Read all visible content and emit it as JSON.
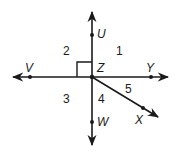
{
  "diagram": {
    "type": "geometry-lines-angles",
    "color": "#1a1a1a",
    "center_point": {
      "label": "Z",
      "x": 92,
      "y": 77
    },
    "points": [
      {
        "label": "U",
        "x": 92,
        "y": 35,
        "label_x": 97,
        "label_y": 38
      },
      {
        "label": "V",
        "x": 30,
        "y": 77,
        "label_x": 25,
        "label_y": 72
      },
      {
        "label": "Y",
        "x": 151,
        "y": 77,
        "label_x": 146,
        "label_y": 72
      },
      {
        "label": "W",
        "x": 92,
        "y": 122,
        "label_x": 97,
        "label_y": 126
      },
      {
        "label": "X",
        "x": 143,
        "y": 108,
        "label_x": 135,
        "label_y": 124
      },
      {
        "label": "Z",
        "x": 92,
        "y": 77,
        "label_x": 97,
        "label_y": 72
      }
    ],
    "lines": [
      {
        "name": "line-VY",
        "from": [
          13,
          77
        ],
        "to": [
          168,
          77
        ],
        "arrows": "both"
      },
      {
        "name": "line-UW",
        "from": [
          92,
          12
        ],
        "to": [
          92,
          145
        ],
        "arrows": "both"
      },
      {
        "name": "ray-ZX",
        "from": [
          92,
          77
        ],
        "to": [
          158,
          117
        ],
        "arrows": "end"
      }
    ],
    "right_angle_marker": {
      "x": 77,
      "y": 62,
      "size": 15
    },
    "angle_labels": [
      {
        "label": "1",
        "x": 116,
        "y": 55
      },
      {
        "label": "2",
        "x": 63,
        "y": 55
      },
      {
        "label": "3",
        "x": 63,
        "y": 103
      },
      {
        "label": "4",
        "x": 98,
        "y": 103
      },
      {
        "label": "5",
        "x": 125,
        "y": 93
      }
    ]
  }
}
